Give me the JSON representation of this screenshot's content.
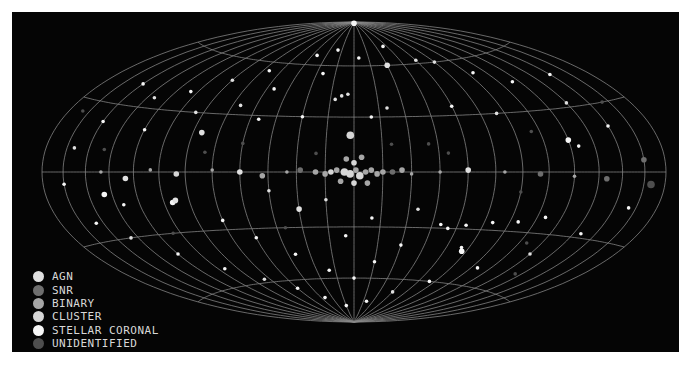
{
  "chart_data": {
    "type": "scatter",
    "projection": "hammer-aitoff (galactic, center lon 0)",
    "title": "",
    "grid": {
      "on": true,
      "meridian_step_deg": 15,
      "parallels_deg": [
        -60,
        -30,
        0,
        30,
        60
      ]
    },
    "legend": {
      "placement": "bottom-left",
      "entries": [
        {
          "key": "agn",
          "label": "AGN",
          "color": "#e0e0e0"
        },
        {
          "key": "snr",
          "label": "SNR",
          "color": "#6e6e6e"
        },
        {
          "key": "binary",
          "label": "BINARY",
          "color": "#a6a6a6"
        },
        {
          "key": "cluster",
          "label": "CLUSTER",
          "color": "#d6d6d6"
        },
        {
          "key": "stellar",
          "label": "STELLAR CORONAL",
          "color": "#f6f6f6"
        },
        {
          "key": "unid",
          "label": "UNIDENTIFIED",
          "color": "#4e4e4e"
        }
      ]
    },
    "xlabel": "Galactic longitude",
    "ylabel": "Galactic latitude",
    "xlim": [
      -180,
      180
    ],
    "ylim": [
      -90,
      90
    ],
    "points": [
      {
        "lon": 0,
        "lat": 89,
        "type": "stellar",
        "s": 3
      },
      {
        "lon": -12,
        "lat": 40,
        "type": "agn",
        "s": 2
      },
      {
        "lon": -8,
        "lat": 42,
        "type": "agn",
        "s": 2
      },
      {
        "lon": -4,
        "lat": 43,
        "type": "agn",
        "s": 2
      },
      {
        "lon": -2,
        "lat": 20,
        "type": "cluster",
        "s": 4
      },
      {
        "lon": 30,
        "lat": 60,
        "type": "agn",
        "s": 3
      },
      {
        "lon": -20,
        "lat": 70,
        "type": "stellar",
        "s": 2
      },
      {
        "lon": -40,
        "lat": 66,
        "type": "stellar",
        "s": 2
      },
      {
        "lon": 40,
        "lat": 72,
        "type": "stellar",
        "s": 2
      },
      {
        "lon": 60,
        "lat": 62,
        "type": "agn",
        "s": 2
      },
      {
        "lon": -70,
        "lat": 55,
        "type": "stellar",
        "s": 2
      },
      {
        "lon": -90,
        "lat": 48,
        "type": "agn",
        "s": 2
      },
      {
        "lon": -110,
        "lat": 40,
        "type": "stellar",
        "s": 2
      },
      {
        "lon": -130,
        "lat": 35,
        "type": "agn",
        "s": 2
      },
      {
        "lon": -150,
        "lat": 22,
        "type": "stellar",
        "s": 2
      },
      {
        "lon": -160,
        "lat": 10,
        "type": "agn",
        "s": 2
      },
      {
        "lon": -165,
        "lat": -5,
        "type": "stellar",
        "s": 2
      },
      {
        "lon": -155,
        "lat": -22,
        "type": "stellar",
        "s": 2
      },
      {
        "lon": -140,
        "lat": -30,
        "type": "agn",
        "s": 2
      },
      {
        "lon": -120,
        "lat": -40,
        "type": "stellar",
        "s": 2
      },
      {
        "lon": -100,
        "lat": -50,
        "type": "stellar",
        "s": 2
      },
      {
        "lon": -80,
        "lat": -58,
        "type": "agn",
        "s": 2
      },
      {
        "lon": -60,
        "lat": -65,
        "type": "stellar",
        "s": 2
      },
      {
        "lon": -40,
        "lat": -72,
        "type": "stellar",
        "s": 2
      },
      {
        "lon": -15,
        "lat": -78,
        "type": "stellar",
        "s": 2
      },
      {
        "lon": 20,
        "lat": -75,
        "type": "stellar",
        "s": 2
      },
      {
        "lon": 45,
        "lat": -68,
        "type": "agn",
        "s": 2
      },
      {
        "lon": 70,
        "lat": -60,
        "type": "stellar",
        "s": 2
      },
      {
        "lon": 95,
        "lat": -50,
        "type": "stellar",
        "s": 2
      },
      {
        "lon": 120,
        "lat": -40,
        "type": "agn",
        "s": 2
      },
      {
        "lon": 140,
        "lat": -28,
        "type": "stellar",
        "s": 2
      },
      {
        "lon": 160,
        "lat": -15,
        "type": "stellar",
        "s": 2
      },
      {
        "lon": 170,
        "lat": -5,
        "type": "unid",
        "s": 4
      },
      {
        "lon": 165,
        "lat": 5,
        "type": "snr",
        "s": 3
      },
      {
        "lon": 150,
        "lat": 20,
        "type": "stellar",
        "s": 2
      },
      {
        "lon": 135,
        "lat": 32,
        "type": "agn",
        "s": 2
      },
      {
        "lon": 115,
        "lat": 45,
        "type": "stellar",
        "s": 2
      },
      {
        "lon": 95,
        "lat": 52,
        "type": "stellar",
        "s": 2
      },
      {
        "lon": 75,
        "lat": 60,
        "type": "agn",
        "s": 2
      },
      {
        "lon": -5,
        "lat": 0,
        "type": "cluster",
        "s": 4
      },
      {
        "lon": -2,
        "lat": -1,
        "type": "cluster",
        "s": 4
      },
      {
        "lon": 1,
        "lat": 1,
        "type": "binary",
        "s": 3
      },
      {
        "lon": 3,
        "lat": -2,
        "type": "cluster",
        "s": 4
      },
      {
        "lon": 6,
        "lat": 0,
        "type": "binary",
        "s": 3
      },
      {
        "lon": 9,
        "lat": 1,
        "type": "binary",
        "s": 3
      },
      {
        "lon": -9,
        "lat": 1,
        "type": "binary",
        "s": 3
      },
      {
        "lon": -12,
        "lat": 0,
        "type": "cluster",
        "s": 3
      },
      {
        "lon": 12,
        "lat": -1,
        "type": "binary",
        "s": 3
      },
      {
        "lon": 15,
        "lat": 0,
        "type": "binary",
        "s": 3
      },
      {
        "lon": -15,
        "lat": -1,
        "type": "binary",
        "s": 3
      },
      {
        "lon": 0,
        "lat": 5,
        "type": "cluster",
        "s": 3
      },
      {
        "lon": -4,
        "lat": 7,
        "type": "binary",
        "s": 3
      },
      {
        "lon": 4,
        "lat": 8,
        "type": "binary",
        "s": 3
      },
      {
        "lon": 0,
        "lat": -6,
        "type": "cluster",
        "s": 3
      },
      {
        "lon": -7,
        "lat": -5,
        "type": "binary",
        "s": 3
      },
      {
        "lon": 7,
        "lat": -6,
        "type": "binary",
        "s": 3
      },
      {
        "lon": 20,
        "lat": 0,
        "type": "snr",
        "s": 3
      },
      {
        "lon": 25,
        "lat": 1,
        "type": "binary",
        "s": 3
      },
      {
        "lon": 30,
        "lat": -1,
        "type": "binary",
        "s": 2
      },
      {
        "lon": -20,
        "lat": 0,
        "type": "binary",
        "s": 3
      },
      {
        "lon": -28,
        "lat": 1,
        "type": "snr",
        "s": 3
      },
      {
        "lon": -35,
        "lat": 0,
        "type": "binary",
        "s": 2
      },
      {
        "lon": -48,
        "lat": -2,
        "type": "binary",
        "s": 3
      },
      {
        "lon": -60,
        "lat": 0,
        "type": "agn",
        "s": 3
      },
      {
        "lon": -75,
        "lat": 1,
        "type": "binary",
        "s": 2
      },
      {
        "lon": -95,
        "lat": -1,
        "type": "cluster",
        "s": 3
      },
      {
        "lon": -110,
        "lat": 1,
        "type": "binary",
        "s": 2
      },
      {
        "lon": -125,
        "lat": -3,
        "type": "agn",
        "s": 3
      },
      {
        "lon": -140,
        "lat": 0,
        "type": "binary",
        "s": 2
      },
      {
        "lon": 45,
        "lat": 0,
        "type": "binary",
        "s": 2
      },
      {
        "lon": 60,
        "lat": 1,
        "type": "agn",
        "s": 3
      },
      {
        "lon": 80,
        "lat": 0,
        "type": "binary",
        "s": 2
      },
      {
        "lon": 100,
        "lat": -1,
        "type": "snr",
        "s": 3
      },
      {
        "lon": 120,
        "lat": -2,
        "type": "binary",
        "s": 2
      },
      {
        "lon": 140,
        "lat": -3,
        "type": "snr",
        "s": 3
      },
      {
        "lon": -100,
        "lat": -15,
        "type": "stellar",
        "s": 3
      },
      {
        "lon": -98,
        "lat": -14,
        "type": "agn",
        "s": 3
      },
      {
        "lon": -85,
        "lat": 20,
        "type": "agn",
        "s": 3
      },
      {
        "lon": -30,
        "lat": -20,
        "type": "agn",
        "s": 3
      },
      {
        "lon": -45,
        "lat": -10,
        "type": "agn",
        "s": 2
      },
      {
        "lon": 35,
        "lat": -20,
        "type": "agn",
        "s": 2
      },
      {
        "lon": 50,
        "lat": -28,
        "type": "stellar",
        "s": 2
      },
      {
        "lon": 55,
        "lat": -30,
        "type": "stellar",
        "s": 2
      },
      {
        "lon": 65,
        "lat": -28,
        "type": "stellar",
        "s": 2
      },
      {
        "lon": 80,
        "lat": -26,
        "type": "stellar",
        "s": 2
      },
      {
        "lon": 95,
        "lat": -25,
        "type": "stellar",
        "s": 2
      },
      {
        "lon": 110,
        "lat": -22,
        "type": "stellar",
        "s": 2
      },
      {
        "lon": 70,
        "lat": -40,
        "type": "stellar",
        "s": 2
      },
      {
        "lon": 72,
        "lat": -42,
        "type": "stellar",
        "s": 3
      },
      {
        "lon": 120,
        "lat": 15,
        "type": "stellar",
        "s": 3
      },
      {
        "lon": 125,
        "lat": 12,
        "type": "stellar",
        "s": 2
      },
      {
        "lon": 85,
        "lat": 30,
        "type": "agn",
        "s": 2
      },
      {
        "lon": 60,
        "lat": 35,
        "type": "stellar",
        "s": 2
      },
      {
        "lon": 20,
        "lat": 35,
        "type": "agn",
        "s": 2
      },
      {
        "lon": 10,
        "lat": 30,
        "type": "stellar",
        "s": 2
      },
      {
        "lon": -30,
        "lat": 30,
        "type": "stellar",
        "s": 2
      },
      {
        "lon": -55,
        "lat": 28,
        "type": "stellar",
        "s": 2
      },
      {
        "lon": -70,
        "lat": 35,
        "type": "agn",
        "s": 2
      },
      {
        "lon": -120,
        "lat": 20,
        "type": "stellar",
        "s": 2
      },
      {
        "lon": -140,
        "lat": -10,
        "type": "stellar",
        "s": 3
      },
      {
        "lon": -130,
        "lat": -15,
        "type": "stellar",
        "s": 2
      },
      {
        "lon": -75,
        "lat": -25,
        "type": "stellar",
        "s": 2
      },
      {
        "lon": -60,
        "lat": -35,
        "type": "stellar",
        "s": 2
      },
      {
        "lon": -40,
        "lat": -45,
        "type": "stellar",
        "s": 2
      },
      {
        "lon": -20,
        "lat": -55,
        "type": "stellar",
        "s": 2
      },
      {
        "lon": 0,
        "lat": -60,
        "type": "stellar",
        "s": 2
      },
      {
        "lon": 15,
        "lat": -50,
        "type": "stellar",
        "s": 2
      },
      {
        "lon": 30,
        "lat": -40,
        "type": "stellar",
        "s": 2
      },
      {
        "lon": -5,
        "lat": -35,
        "type": "stellar",
        "s": 2
      },
      {
        "lon": 10,
        "lat": -25,
        "type": "stellar",
        "s": 2
      },
      {
        "lon": -15,
        "lat": -15,
        "type": "agn",
        "s": 2
      },
      {
        "lon": -25,
        "lat": 55,
        "type": "stellar",
        "s": 2
      },
      {
        "lon": 5,
        "lat": 65,
        "type": "stellar",
        "s": 2
      },
      {
        "lon": -55,
        "lat": 45,
        "type": "stellar",
        "s": 2
      },
      {
        "lon": -95,
        "lat": 30,
        "type": "agn",
        "s": 2
      },
      {
        "lon": -150,
        "lat": 40,
        "type": "stellar",
        "s": 2
      },
      {
        "lon": 150,
        "lat": 45,
        "type": "stellar",
        "s": 2
      },
      {
        "lon": 100,
        "lat": 20,
        "type": "unid",
        "s": 2
      },
      {
        "lon": -80,
        "lat": 10,
        "type": "unid",
        "s": 2
      },
      {
        "lon": 40,
        "lat": 15,
        "type": "unid",
        "s": 2
      },
      {
        "lon": -40,
        "lat": -30,
        "type": "unid",
        "s": 2
      },
      {
        "lon": 90,
        "lat": -10,
        "type": "unid",
        "s": 2
      },
      {
        "lon": -110,
        "lat": -30,
        "type": "unid",
        "s": 2
      },
      {
        "lon": 130,
        "lat": -50,
        "type": "unid",
        "s": 2
      },
      {
        "lon": -60,
        "lat": 15,
        "type": "unid",
        "s": 2
      },
      {
        "lon": 20,
        "lat": 15,
        "type": "unid",
        "s": 2
      },
      {
        "lon": -20,
        "lat": 10,
        "type": "unid",
        "s": 2
      },
      {
        "lon": 50,
        "lat": 10,
        "type": "unid",
        "s": 2
      },
      {
        "lon": -140,
        "lat": 10,
        "type": "unid",
        "s": 2
      },
      {
        "lon": 160,
        "lat": 30,
        "type": "unid",
        "s": 2
      },
      {
        "lon": -170,
        "lat": 25,
        "type": "unid",
        "s": 2
      },
      {
        "lon": 110,
        "lat": -35,
        "type": "unid",
        "s": 2
      }
    ]
  }
}
